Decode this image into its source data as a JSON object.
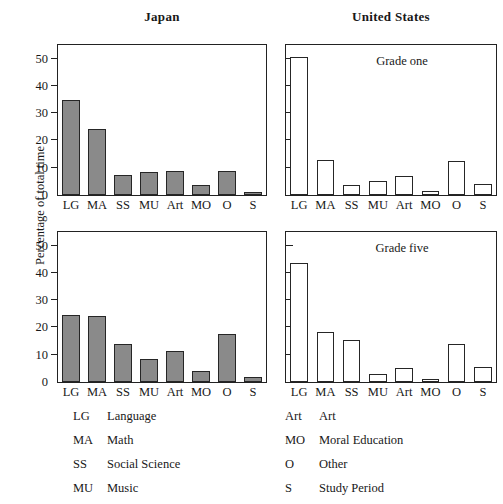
{
  "figure": {
    "ylabel": "Percentage of total time",
    "column_titles": {
      "left": "Japan",
      "right": "United States"
    },
    "annotations": {
      "grade_one": "Grade one",
      "grade_five": "Grade five"
    }
  },
  "legend": {
    "left_column": [
      {
        "abbr": "LG",
        "name": "Language"
      },
      {
        "abbr": "MA",
        "name": "Math"
      },
      {
        "abbr": "SS",
        "name": "Social Science"
      },
      {
        "abbr": "MU",
        "name": "Music"
      }
    ],
    "right_column": [
      {
        "abbr": "Art",
        "name": "Art"
      },
      {
        "abbr": "MO",
        "name": "Moral Education"
      },
      {
        "abbr": "O",
        "name": "Other"
      },
      {
        "abbr": "S",
        "name": "Study Period"
      }
    ]
  },
  "colors": {
    "japan_bar_fill": "#8a8a8a",
    "us_bar_fill": "#ffffff",
    "bar_stroke": "#262626",
    "axis": "#222222",
    "background": "#ffffff"
  },
  "chart_data": [
    {
      "id": "japan-grade-one",
      "type": "bar",
      "title": "Japan",
      "annotation": "",
      "panel": "top-left",
      "xlabel": "",
      "ylabel": "Percentage of total time",
      "ylim": [
        0,
        55
      ],
      "yticks": [
        0,
        10,
        20,
        30,
        40,
        50
      ],
      "ytick_labels": [
        "0",
        "10",
        "20",
        "30",
        "40",
        "50"
      ],
      "grid": false,
      "bar_style": "filled-gray",
      "categories": [
        "LG",
        "MA",
        "SS",
        "MU",
        "Art",
        "MO",
        "O",
        "S"
      ],
      "values": [
        35.0,
        24.3,
        7.3,
        8.6,
        8.8,
        3.6,
        8.9,
        1.0
      ]
    },
    {
      "id": "us-grade-one",
      "type": "bar",
      "title": "United States",
      "annotation": "Grade one",
      "panel": "top-right",
      "xlabel": "",
      "ylabel": "",
      "ylim": [
        0,
        55
      ],
      "yticks": [
        0,
        10,
        20,
        30,
        40,
        50
      ],
      "ytick_labels": [
        "",
        "",
        "",
        "",
        "",
        ""
      ],
      "grid": false,
      "bar_style": "hollow",
      "categories": [
        "LG",
        "MA",
        "SS",
        "MU",
        "Art",
        "MO",
        "O",
        "S"
      ],
      "values": [
        50.5,
        13.0,
        3.5,
        5.0,
        7.0,
        1.5,
        12.5,
        4.0
      ]
    },
    {
      "id": "japan-grade-five",
      "type": "bar",
      "title": "Japan",
      "annotation": "",
      "panel": "bottom-left",
      "xlabel": "",
      "ylabel": "Percentage of total time",
      "ylim": [
        0,
        55
      ],
      "yticks": [
        0,
        10,
        20,
        30,
        40,
        50
      ],
      "ytick_labels": [
        "0",
        "10",
        "20",
        "30",
        "40",
        "50"
      ],
      "grid": false,
      "bar_style": "filled-gray",
      "categories": [
        "LG",
        "MA",
        "SS",
        "MU",
        "Art",
        "MO",
        "O",
        "S"
      ],
      "values": [
        24.7,
        24.3,
        13.8,
        8.5,
        11.3,
        3.9,
        17.5,
        1.8
      ]
    },
    {
      "id": "us-grade-five",
      "type": "bar",
      "title": "United States",
      "annotation": "Grade five",
      "panel": "bottom-right",
      "xlabel": "",
      "ylabel": "",
      "ylim": [
        0,
        55
      ],
      "yticks": [
        0,
        10,
        20,
        30,
        40,
        50
      ],
      "ytick_labels": [
        "",
        "",
        "",
        "",
        "",
        ""
      ],
      "grid": false,
      "bar_style": "hollow",
      "categories": [
        "LG",
        "MA",
        "SS",
        "MU",
        "Art",
        "MO",
        "O",
        "S"
      ],
      "values": [
        43.5,
        18.5,
        15.5,
        3.0,
        5.0,
        1.0,
        14.0,
        5.5
      ]
    }
  ]
}
